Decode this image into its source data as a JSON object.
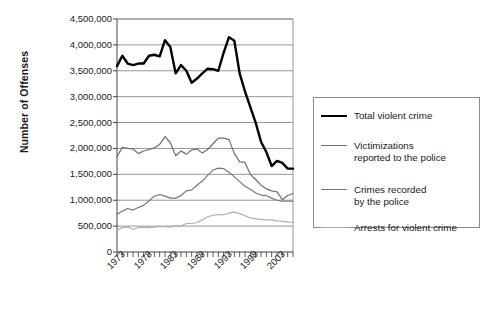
{
  "chart_data": {
    "type": "line",
    "title": "",
    "xlabel": "",
    "ylabel": "Number of Offenses",
    "ylim": [
      0,
      4500000
    ],
    "xlim": [
      1973,
      2006
    ],
    "grid": true,
    "legend_position": "right",
    "ytick_labels": [
      "4,500,000",
      "4,000,000",
      "3,500,000",
      "3,000,000",
      "2,500,000",
      "2,000,000",
      "1,500,000",
      "1,000,000",
      "500,000",
      "0"
    ],
    "ytick_values": [
      4500000,
      4000000,
      3500000,
      3000000,
      2500000,
      2000000,
      1500000,
      1000000,
      500000,
      0
    ],
    "xtick_labels": [
      "1973",
      "1978",
      "1983",
      "1988",
      "1993",
      "1998",
      "2003"
    ],
    "xtick_values": [
      1973,
      1978,
      1983,
      1988,
      1993,
      1998,
      2003
    ],
    "x": [
      1973,
      1974,
      1975,
      1976,
      1977,
      1978,
      1979,
      1980,
      1981,
      1982,
      1983,
      1984,
      1985,
      1986,
      1987,
      1988,
      1989,
      1990,
      1991,
      1992,
      1993,
      1994,
      1995,
      1996,
      1997,
      1998,
      1999,
      2000,
      2001,
      2002,
      2003,
      2004,
      2005,
      2006
    ],
    "series": [
      {
        "name": "Total violent crime",
        "color": "#000000",
        "width": 2.4,
        "values": [
          3590000,
          3790000,
          3640000,
          3610000,
          3640000,
          3640000,
          3790000,
          3810000,
          3780000,
          4090000,
          3960000,
          3450000,
          3610000,
          3500000,
          3270000,
          3350000,
          3450000,
          3540000,
          3530000,
          3500000,
          3850000,
          4150000,
          4080000,
          3450000,
          3100000,
          2800000,
          2500000,
          2130000,
          1930000,
          1660000,
          1760000,
          1720000,
          1610000,
          1610000
        ]
      },
      {
        "name": "Victimizations\nreported to the police",
        "color": "#6e6e6e",
        "width": 1.2,
        "values": [
          1840000,
          2020000,
          2000000,
          1990000,
          1900000,
          1950000,
          1980000,
          2010000,
          2080000,
          2230000,
          2110000,
          1860000,
          1950000,
          1890000,
          1970000,
          1990000,
          1910000,
          1980000,
          2090000,
          2200000,
          2200000,
          2170000,
          1900000,
          1740000,
          1730000,
          1500000,
          1400000,
          1290000,
          1220000,
          1180000,
          1160000,
          1010000,
          1090000,
          1130000
        ]
      },
      {
        "name": "Crimes recorded\nby the police",
        "color": "#767676",
        "width": 1.2,
        "values": [
          730000,
          790000,
          840000,
          810000,
          860000,
          900000,
          990000,
          1080000,
          1110000,
          1080000,
          1040000,
          1040000,
          1090000,
          1180000,
          1200000,
          1290000,
          1370000,
          1480000,
          1580000,
          1620000,
          1610000,
          1540000,
          1450000,
          1360000,
          1270000,
          1210000,
          1140000,
          1100000,
          1090000,
          1040000,
          1000000,
          980000,
          980000,
          980000
        ]
      },
      {
        "name": "Arrests for violent crime",
        "color": "#b0b0b0",
        "width": 1.2,
        "values": [
          420000,
          470000,
          480000,
          440000,
          470000,
          480000,
          470000,
          480000,
          490000,
          490000,
          480000,
          510000,
          500000,
          550000,
          550000,
          570000,
          620000,
          680000,
          710000,
          720000,
          720000,
          750000,
          770000,
          740000,
          700000,
          660000,
          640000,
          630000,
          620000,
          620000,
          600000,
          590000,
          580000,
          570000
        ]
      }
    ]
  },
  "legend": {
    "items": [
      {
        "label": "Total violent crime",
        "color": "#000000"
      },
      {
        "label": "Victimizations\nreported to the police",
        "color": "#6e6e6e"
      },
      {
        "label": "Crimes recorded\nby the police",
        "color": "#767676"
      },
      {
        "label": "Arrests for violent crime",
        "color": "#b0b0b0"
      }
    ]
  },
  "axis": {
    "y_title": "Number of Offenses"
  }
}
